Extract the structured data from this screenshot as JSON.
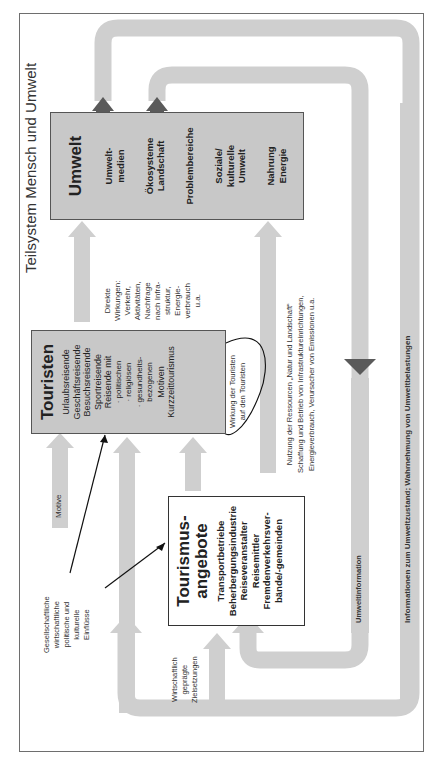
{
  "diagram": {
    "title": "Teilsystem Mensch und Umwelt",
    "umwelt": {
      "title": "Umwelt",
      "items": [
        "Umwelt-\nmedien",
        "Ökosysteme\nLandschaft",
        "Problembereiche",
        "Soziale/\nkulturelle\nUmwelt",
        "Nahrung\nEnergie"
      ]
    },
    "touristen": {
      "title": "Touristen",
      "items": [
        "Urlaubsreisende",
        "Geschäftsreisende",
        "Besuchsreisende",
        "Sportreisende",
        "Reisende mit",
        "· politischen",
        "· religiösen",
        "· gesundheits-",
        "bezogenen",
        "Motiven",
        "Kurzzeittourismus"
      ]
    },
    "tourismus": {
      "title": "Tourismus-\nangebote",
      "items": [
        "Transportbetriebe",
        "Beherbergungsindustrie",
        "Reiseveranstalter",
        "Reisemittler",
        "Fremdenverkehrsver-",
        "bände/-gemeinden"
      ]
    },
    "labels": {
      "direkte_wirkungen": "Direkte\nWirkungen:\nVerkehr,\nAktivitäten,\nNachfrage\nnach Infra-\nstruktur,\nEnergie-\nverbrauch\nu.a.",
      "wirkung_touristen": "Wirkung der Touristen\nauf den Touristen",
      "nutzung": "Nutzung der Ressourcen „Natur und Landschaft“\nSchaffung und Betrieb von Infrastruktureinrichtungen,\nEnergieverbrauch, Verursacher von Emissionen u.a.",
      "umweltinformation": "Umweltinformation",
      "informationen": "Informationen zum Umweltzustand; Wahrnehmung von Umweltbelastungen",
      "motive": "Motive",
      "einfluesse": "Gesellschaftliche\nwirtschaftliche\npolitische und\nkulturelle\nEinflüsse",
      "zielsetzungen": "Wirtschaftlich\ngeprägte\nZielsetzungen"
    },
    "colors": {
      "box_grey": "#c8c8c8",
      "arrow_grey": "#cfcfcf",
      "arrow_dark": "#5a5a5a",
      "frame": "#6e6e6e"
    }
  }
}
